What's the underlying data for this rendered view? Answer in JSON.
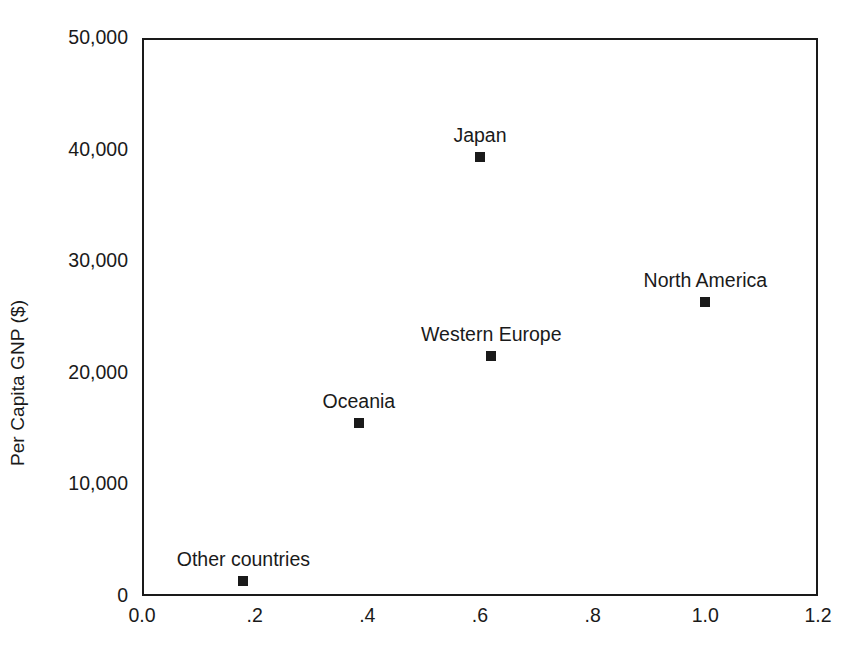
{
  "chart_data": {
    "type": "scatter",
    "title": "",
    "xlabel": "",
    "ylabel": "Per Capita GNP ($)",
    "xlim": [
      0.0,
      1.2
    ],
    "ylim": [
      0,
      50000
    ],
    "grid": false,
    "legend": "none",
    "x_tick_labels": [
      "0.0",
      ".2",
      ".4",
      ".6",
      ".8",
      "1.0",
      "1.2"
    ],
    "x_tick_values": [
      0.0,
      0.2,
      0.4,
      0.6,
      0.8,
      1.0,
      1.2
    ],
    "y_tick_labels": [
      "0",
      "10,000",
      "20,000",
      "30,000",
      "40,000",
      "50,000"
    ],
    "y_tick_values": [
      0,
      10000,
      20000,
      30000,
      40000,
      50000
    ],
    "points": [
      {
        "label": "Japan",
        "x": 0.6,
        "y": 39300
      },
      {
        "label": "North America",
        "x": 1.0,
        "y": 26300
      },
      {
        "label": "Western Europe",
        "x": 0.62,
        "y": 21500
      },
      {
        "label": "Oceania",
        "x": 0.385,
        "y": 15500
      },
      {
        "label": "Other countries",
        "x": 0.18,
        "y": 1300
      }
    ],
    "marker": "filled-square",
    "marker_color": "#1a1a1a",
    "axis_color": "#1a1a1a",
    "background_color": "#ffffff"
  }
}
